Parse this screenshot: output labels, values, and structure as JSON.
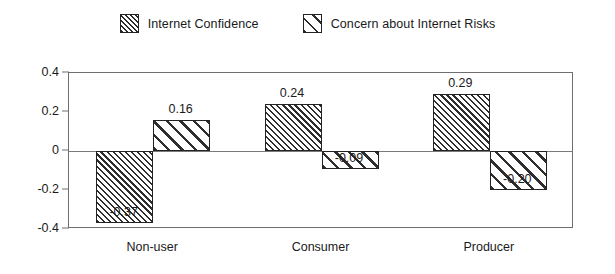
{
  "chart_data": {
    "type": "bar",
    "title": "",
    "subtitle": "",
    "xlabel": "",
    "ylabel": "",
    "categories": [
      "Non-user",
      "Consumer",
      "Producer"
    ],
    "series": [
      {
        "name": "Internet Confidence",
        "pattern": "dense-diagonal-hatch",
        "values": [
          -0.37,
          0.24,
          0.29
        ],
        "labels": [
          "-0.37",
          "0.24",
          "0.29"
        ]
      },
      {
        "name": "Concern about Internet Risks",
        "pattern": "wide-diagonal-hatch",
        "values": [
          0.16,
          -0.09,
          -0.2
        ],
        "labels": [
          "0.16",
          "-0.09",
          "-0.20"
        ]
      }
    ],
    "ylim": [
      -0.4,
      0.4
    ],
    "ytick_values": [
      0.4,
      0.2,
      0,
      -0.2,
      -0.4
    ],
    "ytick_labels": [
      "0.4",
      "0.2",
      "0",
      "-0.2",
      "-0.4"
    ],
    "grid": false,
    "zero_line": true,
    "legend_position": "top-center",
    "colors": {
      "bar_outline": "#232323",
      "hatch": "#2e2e2e",
      "bar_fill": "#ffffff",
      "axis": "#6e6e6e",
      "text": "#1a1a1a",
      "background": "#ffffff"
    }
  },
  "legend": {
    "entries": [
      {
        "label": "Internet Confidence"
      },
      {
        "label": "Concern about Internet Risks"
      }
    ]
  }
}
